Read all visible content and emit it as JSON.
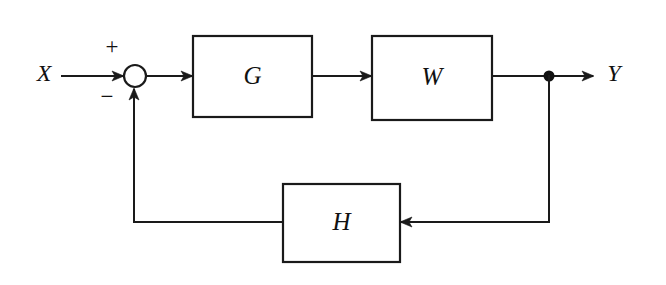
{
  "diagram": {
    "background_color": "#ffffff",
    "line_color": "#1a1a1a",
    "input": {
      "label": "X",
      "name": "input-signal-label"
    },
    "output": {
      "label": "Y",
      "name": "output-signal-label"
    },
    "summing_junction": {
      "shape": "circle",
      "plus_sign": "+",
      "minus_sign": "−",
      "plus_position": "top-left",
      "minus_position": "bottom-left"
    },
    "blocks": [
      {
        "id": "forward-gain",
        "label": "G",
        "shape": "rectangle"
      },
      {
        "id": "plant",
        "label": "W",
        "shape": "rectangle"
      },
      {
        "id": "feedback-gain",
        "label": "H",
        "shape": "rectangle"
      }
    ],
    "takeoff_node": {
      "shape": "filled-dot",
      "label": ""
    },
    "signal_flow": [
      "X into summing junction (positive input)",
      "summing junction into G",
      "G into W",
      "W into output takeoff node",
      "takeoff node into Y",
      "takeoff node down into H (right side input)",
      "H out left and up into summing junction (negative input)"
    ]
  }
}
